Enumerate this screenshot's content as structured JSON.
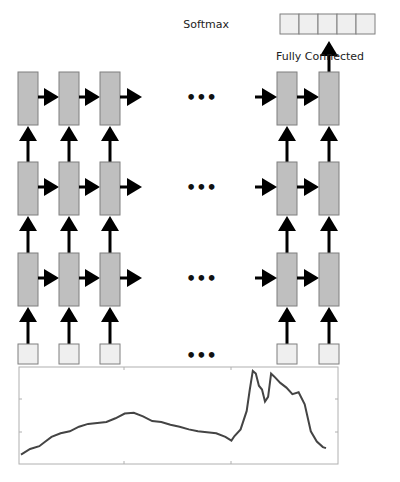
{
  "diagram": {
    "softmax_label": "Softmax",
    "fc_label": "Fully Connected",
    "ellipsis": "•••",
    "softmax_cells": 5,
    "layers": 3,
    "visible_timesteps_left": 3,
    "visible_timesteps_right": 2,
    "colors": {
      "cell_fill": "#bfbfbf",
      "input_fill": "#efefef",
      "border": "#7f7f7f",
      "arrow": "#000000"
    }
  },
  "chart_data": {
    "type": "line",
    "title": "",
    "xlabel": "",
    "ylabel": "",
    "grid": false,
    "xlim": [
      0,
      100
    ],
    "ylim": [
      0,
      100
    ],
    "series": [
      {
        "name": "input-signal",
        "x": [
          0,
          3,
          6,
          8,
          10,
          13,
          16,
          19,
          22,
          25,
          28,
          31,
          34,
          37,
          40,
          43,
          46,
          49,
          52,
          55,
          58,
          61,
          64,
          67,
          69,
          70,
          72,
          74,
          75,
          76,
          77,
          78,
          79,
          80,
          81,
          82,
          83,
          85,
          87,
          89,
          91,
          93,
          95,
          97,
          99,
          100
        ],
        "values": [
          8,
          14,
          17,
          22,
          27,
          31,
          33,
          38,
          41,
          42,
          43,
          47,
          52,
          53,
          49,
          44,
          43,
          40,
          38,
          35,
          33,
          32,
          31,
          27,
          23,
          28,
          35,
          55,
          78,
          98,
          95,
          82,
          78,
          65,
          70,
          95,
          92,
          85,
          80,
          73,
          75,
          62,
          33,
          22,
          16,
          15
        ]
      }
    ]
  }
}
